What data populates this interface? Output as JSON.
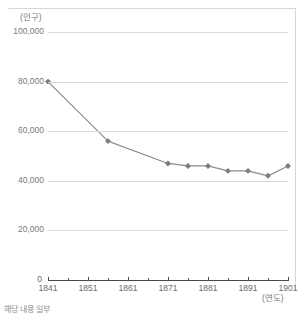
{
  "chart_data": {
    "type": "line",
    "title": "",
    "xlabel": "(연도)",
    "ylabel": "(인구)",
    "xlim": [
      1841,
      1901
    ],
    "ylim": [
      0,
      100000
    ],
    "grid": "horizontal",
    "legend": "none",
    "line_color": "#8c8c8c",
    "marker_color": "#7b7b7b",
    "x": [
      1841,
      1856,
      1871,
      1876,
      1881,
      1886,
      1891,
      1896,
      1901
    ],
    "values": [
      80000,
      56000,
      47000,
      46000,
      46000,
      44000,
      44000,
      42000,
      46000
    ],
    "series": [
      {
        "name": "인구",
        "x": [
          1841,
          1856,
          1871,
          1876,
          1881,
          1886,
          1891,
          1896,
          1901
        ],
        "values": [
          80000,
          56000,
          47000,
          46000,
          46000,
          44000,
          44000,
          42000,
          46000
        ]
      }
    ],
    "y_ticks": [
      0,
      20000,
      40000,
      60000,
      80000,
      100000
    ],
    "y_tick_labels": [
      "0",
      "20,000",
      "40,000",
      "60,000",
      "80,000",
      "100,000"
    ],
    "x_ticks": [
      1841,
      1851,
      1861,
      1871,
      1881,
      1891,
      1901
    ],
    "x_tick_labels": [
      "1841",
      "1851",
      "1861",
      "1871",
      "1881",
      "1891",
      "1901"
    ],
    "x_minor_ticks": [
      1846,
      1856,
      1866,
      1876,
      1886,
      1896
    ]
  },
  "axes": {
    "y_label": "(인구)",
    "x_label": "(연도)",
    "zero_label": "0"
  },
  "caption": "해당 내용 일부"
}
